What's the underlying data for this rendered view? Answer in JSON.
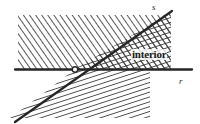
{
  "figure": {
    "kind": "geometry-diagram",
    "caption_labels": {
      "ray_s": "s",
      "ray_r": "r",
      "interior": "interior"
    },
    "colors": {
      "background": "#ffffff",
      "ink": "#262626",
      "hatch": "#3a3a3a",
      "label": "#1a1a1a"
    },
    "geometry": {
      "vertex": {
        "x": 75,
        "y": 69
      },
      "ray_r": {
        "x1": 15,
        "y1": 69,
        "x2": 192,
        "y2": 69,
        "stroke_width": 2.2
      },
      "ray_s": {
        "x1": 15,
        "y1": 122,
        "x2": 172,
        "y2": 11,
        "stroke_width": 2.2
      },
      "upper_band": {
        "x": 18,
        "y": 15,
        "width": 152,
        "height": 54
      },
      "lower_band": {
        "x": 10,
        "y": 69,
        "width": 138,
        "height": 48
      },
      "hatch_angle_upper_deg": -35,
      "hatch_angle_lower_deg": 72,
      "vertex_dot_radius": 2.6
    },
    "regions": [
      {
        "name": "half-plane-above-r",
        "hatch": "single"
      },
      {
        "name": "half-plane-right-of-s",
        "hatch": "single"
      },
      {
        "name": "interior-wedge",
        "hatch": "cross"
      }
    ]
  }
}
